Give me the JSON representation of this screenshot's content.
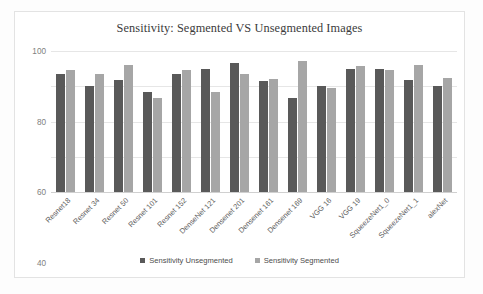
{
  "chart_data": {
    "type": "bar",
    "title": "Sensitivity: Segmented VS Unsegmented Images",
    "xlabel": "",
    "ylabel": "",
    "ylim": [
      20,
      100
    ],
    "yticks": [
      100,
      80,
      60,
      40,
      20
    ],
    "grid": true,
    "legend_position": "bottom",
    "categories": [
      "Resnet18",
      "Resnet 34",
      "Resnet 50",
      "Resnet 101",
      "Resnet 152",
      "DenseNet 121",
      "Densenet 201",
      "Densenet 161",
      "Densenet 169",
      "VGG 16",
      "VGG 19",
      "SqueezeNet1_0",
      "SqueezeNet1_1",
      "alexNet"
    ],
    "series": [
      {
        "name": "Sensitivity Unsegmented",
        "color": "#595959",
        "values": [
          87,
          80,
          83.5,
          77,
          87,
          90,
          93,
          83,
          73.5,
          80,
          90,
          90,
          83.5,
          80
        ]
      },
      {
        "name": "Sensitivity Segmented",
        "color": "#a6a6a6",
        "values": [
          89.5,
          87,
          92,
          73.5,
          89.5,
          76.5,
          87,
          84,
          94.5,
          79,
          91.5,
          89.5,
          92,
          84.5
        ]
      }
    ]
  },
  "legend": {
    "items": [
      {
        "label": "Sensitivity Unsegmented",
        "color": "#595959"
      },
      {
        "label": "Sensitivity Segmented",
        "color": "#a6a6a6"
      }
    ]
  }
}
